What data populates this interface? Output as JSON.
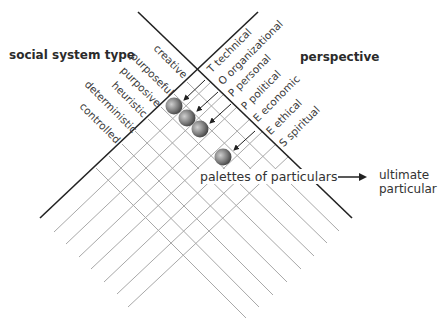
{
  "headings": {
    "left": "social system type",
    "right": "perspective"
  },
  "system_types": [
    "creative",
    "purposeful",
    "purposive",
    "heuristic",
    "deterministic",
    "controlled"
  ],
  "perspectives": [
    {
      "code": "T",
      "label": "technical"
    },
    {
      "code": "O",
      "label": "organizational"
    },
    {
      "code": "P",
      "label": "personal"
    },
    {
      "code": "P",
      "label": "political"
    },
    {
      "code": "E",
      "label": "economic"
    },
    {
      "code": "E",
      "label": "ethical"
    },
    {
      "code": "S",
      "label": "spiritual"
    }
  ],
  "annotations": {
    "palettes": "palettes of particulars",
    "ultimate_line1": "ultimate",
    "ultimate_line2": "particular"
  },
  "colors": {
    "axis": "#222222",
    "grid": "#a8a8a8",
    "sphere_dark": "#3a3a3a",
    "sphere_light": "#d8d8d8"
  }
}
